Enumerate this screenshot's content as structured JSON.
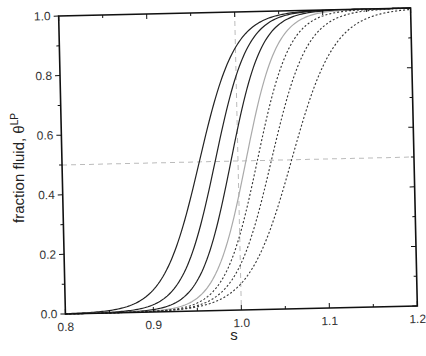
{
  "chart_data": {
    "type": "line",
    "title": "",
    "xlabel": "s",
    "ylabel": "fraction fluid, θ",
    "ylabel_superscript": "LP",
    "xlim": [
      0.8,
      1.2
    ],
    "ylim": [
      0.0,
      1.0
    ],
    "x_ticks": [
      "0.8",
      "0.9",
      "1.0",
      "1.1",
      "1.2"
    ],
    "y_ticks": [
      "0.0",
      "0.2",
      "0.4",
      "0.6",
      "0.8",
      "1.0"
    ],
    "grid": false,
    "legend": null,
    "reference_lines": [
      {
        "orientation": "horizontal",
        "value": 0.5,
        "style": "dashed",
        "color": "#bbbbbb"
      },
      {
        "orientation": "vertical",
        "value": 1.0,
        "style": "dashed",
        "color": "#bbbbbb"
      }
    ],
    "series": [
      {
        "name": "curve-1",
        "style": "solid",
        "color": "#222222",
        "midpoint": 0.956,
        "width": 0.022,
        "x": [
          0.8,
          0.85,
          0.9,
          0.92,
          0.94,
          0.95,
          0.96,
          0.97,
          0.98,
          1.0,
          1.05,
          1.1,
          1.2
        ],
        "values": [
          0.04,
          0.1,
          0.23,
          0.34,
          0.43,
          0.48,
          0.55,
          0.66,
          0.77,
          0.92,
          0.98,
          0.99,
          1.0
        ]
      },
      {
        "name": "curve-2",
        "style": "solid",
        "color": "#222222",
        "midpoint": 0.974,
        "width": 0.02,
        "x": [
          0.8,
          0.85,
          0.9,
          0.93,
          0.95,
          0.97,
          0.98,
          0.99,
          1.0,
          1.02,
          1.05,
          1.1,
          1.2
        ],
        "values": [
          0.02,
          0.05,
          0.12,
          0.22,
          0.32,
          0.45,
          0.57,
          0.68,
          0.78,
          0.9,
          0.96,
          0.99,
          1.0
        ]
      },
      {
        "name": "curve-3",
        "style": "solid",
        "color": "#222222",
        "midpoint": 0.992,
        "width": 0.019,
        "x": [
          0.8,
          0.85,
          0.9,
          0.95,
          0.97,
          0.99,
          1.0,
          1.01,
          1.02,
          1.04,
          1.07,
          1.1,
          1.2
        ],
        "values": [
          0.01,
          0.02,
          0.05,
          0.15,
          0.26,
          0.45,
          0.57,
          0.68,
          0.76,
          0.88,
          0.95,
          0.98,
          1.0
        ]
      },
      {
        "name": "curve-4",
        "style": "solid",
        "color": "#aaaaaa",
        "midpoint": 1.009,
        "width": 0.019,
        "x": [
          0.8,
          0.85,
          0.9,
          0.95,
          0.98,
          1.0,
          1.01,
          1.02,
          1.03,
          1.05,
          1.08,
          1.12,
          1.2
        ],
        "values": [
          0.0,
          0.01,
          0.02,
          0.07,
          0.16,
          0.36,
          0.51,
          0.63,
          0.73,
          0.85,
          0.93,
          0.97,
          0.99
        ]
      },
      {
        "name": "curve-5",
        "style": "dotted",
        "color": "#333333",
        "midpoint": 1.022,
        "width": 0.02,
        "x": [
          0.8,
          0.85,
          0.9,
          0.95,
          0.99,
          1.01,
          1.02,
          1.03,
          1.05,
          1.07,
          1.1,
          1.15,
          1.2
        ],
        "values": [
          0.0,
          0.0,
          0.01,
          0.04,
          0.17,
          0.35,
          0.48,
          0.6,
          0.78,
          0.88,
          0.94,
          0.97,
          0.99
        ]
      },
      {
        "name": "curve-6",
        "style": "dotted",
        "color": "#333333",
        "midpoint": 1.038,
        "width": 0.022,
        "x": [
          0.8,
          0.85,
          0.9,
          0.95,
          1.0,
          1.02,
          1.04,
          1.05,
          1.07,
          1.09,
          1.12,
          1.16,
          1.2
        ],
        "values": [
          0.0,
          0.0,
          0.01,
          0.02,
          0.13,
          0.29,
          0.52,
          0.62,
          0.77,
          0.86,
          0.92,
          0.95,
          0.97
        ]
      },
      {
        "name": "curve-7",
        "style": "dotted",
        "color": "#333333",
        "midpoint": 1.061,
        "width": 0.026,
        "x": [
          0.8,
          0.85,
          0.9,
          0.95,
          1.0,
          1.03,
          1.05,
          1.06,
          1.08,
          1.1,
          1.13,
          1.16,
          1.2
        ],
        "values": [
          0.0,
          0.0,
          0.0,
          0.01,
          0.08,
          0.21,
          0.38,
          0.49,
          0.66,
          0.78,
          0.87,
          0.92,
          0.95
        ]
      }
    ]
  },
  "plot": {
    "frame": {
      "left": 62,
      "top": 12,
      "right": 414,
      "bottom": 310
    },
    "rotation_deg": -1.3
  }
}
